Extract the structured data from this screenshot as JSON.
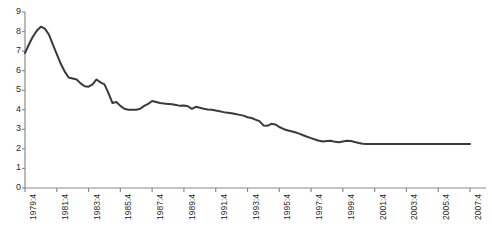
{
  "chart_data": {
    "type": "line",
    "title": "",
    "subtitle": "",
    "xlabel": "",
    "ylabel": "",
    "grid": false,
    "legend": false,
    "legend_position": "none",
    "line_color": "#3a3a3a",
    "line_width": 2,
    "markers": false,
    "background_color": "#ffffff",
    "axis_color": "#8a8a8a",
    "ylim": [
      0,
      9
    ],
    "y_ticks": [
      0,
      1,
      2,
      3,
      4,
      5,
      6,
      7,
      8,
      9
    ],
    "y_tick_labels": [
      "0",
      "1",
      "2",
      "3",
      "4",
      "5",
      "6",
      "7",
      "8",
      "9"
    ],
    "x_tick_labels": [
      "1979:4",
      "1981:4",
      "1983:4",
      "1985:4",
      "1987:4",
      "1989:4",
      "1991:4",
      "1993:4",
      "1995:4",
      "1997:4",
      "1999:4",
      "2001:4",
      "2003:4",
      "2005:4",
      "2007:4"
    ],
    "x_tick_interval_quarters": 8,
    "x_start_label": "1979:4",
    "x_end_label": "2007:4",
    "x_labels_rotated_degrees": 90,
    "n_points": 113,
    "x": [
      "1979:4",
      "1980:1",
      "1980:2",
      "1980:3",
      "1980:4",
      "1981:1",
      "1981:2",
      "1981:3",
      "1981:4",
      "1982:1",
      "1982:2",
      "1982:3",
      "1982:4",
      "1983:1",
      "1983:2",
      "1983:3",
      "1983:4",
      "1984:1",
      "1984:2",
      "1984:3",
      "1984:4",
      "1985:1",
      "1985:2",
      "1985:3",
      "1985:4",
      "1986:1",
      "1986:2",
      "1986:3",
      "1986:4",
      "1987:1",
      "1987:2",
      "1987:3",
      "1987:4",
      "1988:1",
      "1988:2",
      "1988:3",
      "1988:4",
      "1989:1",
      "1989:2",
      "1989:3",
      "1989:4",
      "1990:1",
      "1990:2",
      "1990:3",
      "1990:4",
      "1991:1",
      "1991:2",
      "1991:3",
      "1991:4",
      "1992:1",
      "1992:2",
      "1992:3",
      "1992:4",
      "1993:1",
      "1993:2",
      "1993:3",
      "1993:4",
      "1994:1",
      "1994:2",
      "1994:3",
      "1994:4",
      "1995:1",
      "1995:2",
      "1995:3",
      "1995:4",
      "1996:1",
      "1996:2",
      "1996:3",
      "1996:4",
      "1997:1",
      "1997:2",
      "1997:3",
      "1997:4",
      "1998:1",
      "1998:2",
      "1998:3",
      "1998:4",
      "1999:1",
      "1999:2",
      "1999:3",
      "1999:4",
      "2000:1",
      "2000:2",
      "2000:3",
      "2000:4",
      "2001:1",
      "2001:2",
      "2001:3",
      "2001:4",
      "2002:1",
      "2002:2",
      "2002:3",
      "2002:4",
      "2003:1",
      "2003:2",
      "2003:3",
      "2003:4",
      "2004:1",
      "2004:2",
      "2004:3",
      "2004:4",
      "2005:1",
      "2005:2",
      "2005:3",
      "2005:4",
      "2006:1",
      "2006:2",
      "2006:3",
      "2006:4",
      "2007:1",
      "2007:2",
      "2007:3",
      "2007:4"
    ],
    "values": [
      6.9,
      7.35,
      7.75,
      8.05,
      8.25,
      8.15,
      7.85,
      7.35,
      6.85,
      6.35,
      5.95,
      5.65,
      5.6,
      5.55,
      5.35,
      5.2,
      5.18,
      5.3,
      5.55,
      5.4,
      5.3,
      4.85,
      4.35,
      4.4,
      4.2,
      4.05,
      4.0,
      4.0,
      4.0,
      4.05,
      4.2,
      4.3,
      4.45,
      4.4,
      4.35,
      4.32,
      4.3,
      4.28,
      4.25,
      4.2,
      4.22,
      4.18,
      4.05,
      4.15,
      4.1,
      4.05,
      4.02,
      4.0,
      3.96,
      3.92,
      3.88,
      3.85,
      3.82,
      3.78,
      3.74,
      3.7,
      3.62,
      3.58,
      3.5,
      3.42,
      3.2,
      3.18,
      3.28,
      3.25,
      3.12,
      3.02,
      2.95,
      2.9,
      2.85,
      2.78,
      2.7,
      2.62,
      2.55,
      2.48,
      2.42,
      2.38,
      2.4,
      2.42,
      2.36,
      2.34,
      2.38,
      2.42,
      2.4,
      2.35,
      2.3,
      2.26,
      2.25,
      2.25,
      2.25,
      2.25,
      2.25,
      2.25,
      2.25,
      2.25,
      2.25,
      2.25,
      2.25,
      2.25,
      2.25,
      2.25,
      2.25,
      2.25,
      2.25,
      2.25,
      2.25,
      2.25,
      2.25,
      2.25,
      2.25,
      2.25,
      2.25,
      2.25,
      2.25
    ],
    "annotations": []
  },
  "caption": {
    "text": ""
  }
}
